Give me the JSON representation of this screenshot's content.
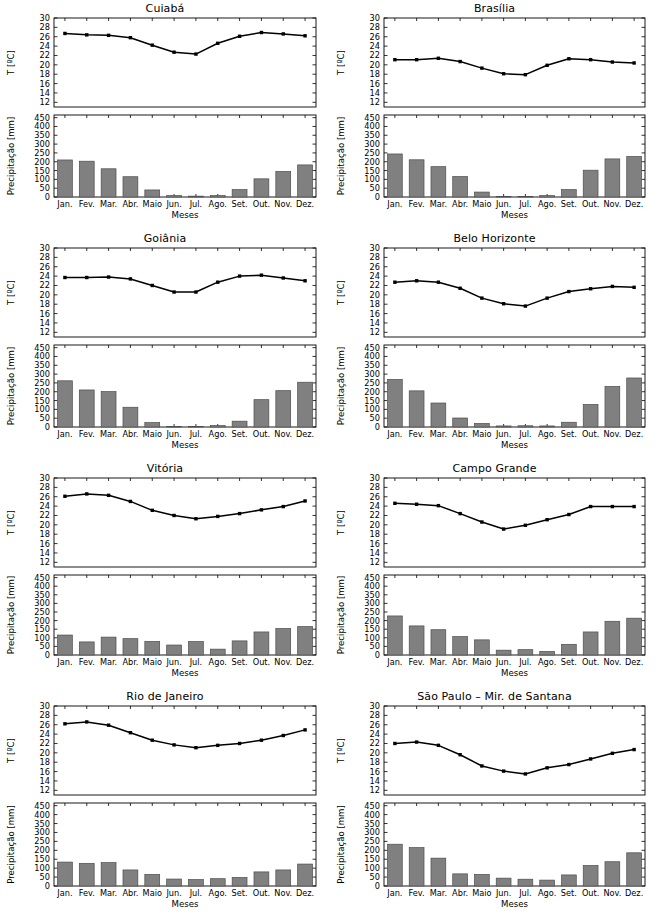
{
  "figure": {
    "months": [
      "Jan.",
      "Fev.",
      "Mar.",
      "Abr.",
      "Maio",
      "Jun.",
      "Jul.",
      "Ago.",
      "Set.",
      "Out.",
      "Nov.",
      "Dez."
    ],
    "temp_axis_label": "T [ºC]",
    "precip_axis_label": "Precipitação [mm]",
    "x_axis_label": "Meses",
    "temp_ticks": [
      12,
      14,
      16,
      18,
      20,
      22,
      24,
      26,
      28,
      30
    ],
    "precip_ticks": [
      0,
      50,
      100,
      150,
      200,
      250,
      300,
      350,
      400,
      450
    ],
    "temp_ylim": [
      11,
      30
    ],
    "precip_ylim": [
      0,
      465
    ],
    "bar_color": "#808080",
    "bar_edge_color": "#4d4d4d",
    "line_color": "#000000"
  },
  "panels": [
    {
      "title": "Cuiabá",
      "temp_label": "T [ºC]",
      "precip_label": "Precipitação [mm]",
      "x_label": "Meses"
    },
    {
      "title": "Brasília",
      "temp_label": "T [ºC]",
      "precip_label": "Precipitação [mm]",
      "x_label": "Meses"
    },
    {
      "title": "Goiânia",
      "temp_label": "T [ºC]",
      "precip_label": "Precipitação [mm]",
      "x_label": "Meses"
    },
    {
      "title": "Belo Horizonte",
      "temp_label": "T [ºC]",
      "precip_label": "Precipitação [mm]",
      "x_label": "Meses"
    },
    {
      "title": "Vitória",
      "temp_label": "T [ºC]",
      "precip_label": "Precipitação [mm]",
      "x_label": "Meses"
    },
    {
      "title": "Campo Grande",
      "temp_label": "T [ºC]",
      "precip_label": "Precipitação [mm]",
      "x_label": "Meses"
    },
    {
      "title": "Rio de Janeiro",
      "temp_label": "T [ºC]",
      "precip_label": "Precipitação [mm]",
      "x_label": "Meses"
    },
    {
      "title": "São Paulo – Mir. de Santana",
      "temp_label": "T [ºC]",
      "precip_label": "Precipitação [mm]",
      "x_label": "Meses"
    }
  ],
  "chart_data": [
    {
      "type": "line",
      "title": "Cuiabá",
      "subtitle": "temperature",
      "xlabel": "Meses",
      "ylabel": "T [ºC]",
      "ylim": [
        11,
        30
      ],
      "grid": false,
      "categories": [
        "Jan.",
        "Fev.",
        "Mar.",
        "Abr.",
        "Maio",
        "Jun.",
        "Jul.",
        "Ago.",
        "Set.",
        "Out.",
        "Nov.",
        "Dez."
      ],
      "values": [
        26.7,
        26.4,
        26.3,
        25.8,
        24.2,
        22.7,
        22.3,
        24.6,
        26.1,
        26.9,
        26.6,
        26.2
      ]
    },
    {
      "type": "bar",
      "title": "Cuiabá",
      "subtitle": "precipitation",
      "xlabel": "Meses",
      "ylabel": "Precipitação [mm]",
      "ylim": [
        0,
        465
      ],
      "grid": false,
      "categories": [
        "Jan.",
        "Fev.",
        "Mar.",
        "Abr.",
        "Maio",
        "Jun.",
        "Jul.",
        "Ago.",
        "Set.",
        "Out.",
        "Nov.",
        "Dez."
      ],
      "values": [
        210,
        203,
        160,
        115,
        40,
        8,
        5,
        8,
        42,
        103,
        145,
        182
      ]
    },
    {
      "type": "line",
      "title": "Brasília",
      "subtitle": "temperature",
      "xlabel": "Meses",
      "ylabel": "T [ºC]",
      "ylim": [
        11,
        30
      ],
      "grid": false,
      "categories": [
        "Jan.",
        "Fev.",
        "Mar.",
        "Abr.",
        "Maio",
        "Jun.",
        "Jul.",
        "Ago.",
        "Set.",
        "Out.",
        "Nov.",
        "Dez."
      ],
      "values": [
        21.1,
        21.1,
        21.4,
        20.7,
        19.3,
        18.1,
        17.9,
        19.9,
        21.3,
        21.1,
        20.6,
        20.4
      ]
    },
    {
      "type": "bar",
      "title": "Brasília",
      "subtitle": "precipitation",
      "xlabel": "Meses",
      "ylabel": "Precipitação [mm]",
      "ylim": [
        0,
        465
      ],
      "grid": false,
      "categories": [
        "Jan.",
        "Fev.",
        "Mar.",
        "Abr.",
        "Maio",
        "Jun.",
        "Jul.",
        "Ago.",
        "Set.",
        "Out.",
        "Nov.",
        "Dez."
      ],
      "values": [
        244,
        211,
        172,
        116,
        28,
        3,
        3,
        8,
        42,
        152,
        216,
        230
      ]
    },
    {
      "type": "line",
      "title": "Goiânia",
      "subtitle": "temperature",
      "xlabel": "Meses",
      "ylabel": "T [ºC]",
      "ylim": [
        11,
        30
      ],
      "grid": false,
      "categories": [
        "Jan.",
        "Fev.",
        "Mar.",
        "Abr.",
        "Maio",
        "Jun.",
        "Jul.",
        "Ago.",
        "Set.",
        "Out.",
        "Nov.",
        "Dez."
      ],
      "values": [
        23.7,
        23.7,
        23.8,
        23.4,
        22.0,
        20.6,
        20.6,
        22.7,
        24.0,
        24.2,
        23.6,
        23.0
      ]
    },
    {
      "type": "bar",
      "title": "Goiânia",
      "subtitle": "precipitation",
      "xlabel": "Meses",
      "ylabel": "Precipitação [mm]",
      "ylim": [
        0,
        465
      ],
      "grid": false,
      "categories": [
        "Jan.",
        "Fev.",
        "Mar.",
        "Abr.",
        "Maio",
        "Jun.",
        "Jul.",
        "Ago.",
        "Set.",
        "Out.",
        "Nov.",
        "Dez."
      ],
      "values": [
        262,
        210,
        201,
        112,
        25,
        3,
        2,
        8,
        33,
        155,
        206,
        254
      ]
    },
    {
      "type": "line",
      "title": "Belo Horizonte",
      "subtitle": "temperature",
      "xlabel": "Meses",
      "ylabel": "T [ºC]",
      "ylim": [
        11,
        30
      ],
      "grid": false,
      "categories": [
        "Jan.",
        "Fev.",
        "Mar.",
        "Abr.",
        "Maio",
        "Jun.",
        "Jul.",
        "Ago.",
        "Set.",
        "Out.",
        "Nov.",
        "Dez."
      ],
      "values": [
        22.7,
        23.0,
        22.7,
        21.4,
        19.3,
        18.1,
        17.6,
        19.3,
        20.7,
        21.3,
        21.8,
        21.6
      ]
    },
    {
      "type": "bar",
      "title": "Belo Horizonte",
      "subtitle": "precipitation",
      "xlabel": "Meses",
      "ylabel": "Precipitação [mm]",
      "ylim": [
        0,
        465
      ],
      "grid": false,
      "categories": [
        "Jan.",
        "Fev.",
        "Mar.",
        "Abr.",
        "Maio",
        "Jun.",
        "Jul.",
        "Ago.",
        "Set.",
        "Out.",
        "Nov.",
        "Dez."
      ],
      "values": [
        270,
        205,
        136,
        51,
        20,
        6,
        7,
        6,
        27,
        128,
        230,
        278
      ]
    },
    {
      "type": "line",
      "title": "Vitória",
      "subtitle": "temperature",
      "xlabel": "Meses",
      "ylabel": "T [ºC]",
      "ylim": [
        11,
        30
      ],
      "grid": false,
      "categories": [
        "Jan.",
        "Fev.",
        "Mar.",
        "Abr.",
        "Maio",
        "Jun.",
        "Jul.",
        "Ago.",
        "Set.",
        "Out.",
        "Nov.",
        "Dez."
      ],
      "values": [
        26.1,
        26.6,
        26.3,
        25.0,
        23.1,
        22.0,
        21.3,
        21.8,
        22.4,
        23.2,
        23.9,
        25.1
      ]
    },
    {
      "type": "bar",
      "title": "Vitória",
      "subtitle": "precipitation",
      "xlabel": "Meses",
      "ylabel": "Precipitação [mm]",
      "ylim": [
        0,
        465
      ],
      "grid": false,
      "categories": [
        "Jan.",
        "Fev.",
        "Mar.",
        "Abr.",
        "Maio",
        "Jun.",
        "Jul.",
        "Ago.",
        "Set.",
        "Out.",
        "Nov.",
        "Dez."
      ],
      "values": [
        116,
        76,
        104,
        95,
        79,
        58,
        78,
        34,
        82,
        134,
        154,
        165
      ]
    },
    {
      "type": "line",
      "title": "Campo Grande",
      "subtitle": "temperature",
      "xlabel": "Meses",
      "ylabel": "T [ºC]",
      "ylim": [
        11,
        30
      ],
      "grid": false,
      "categories": [
        "Jan.",
        "Fev.",
        "Mar.",
        "Abr.",
        "Maio",
        "Jun.",
        "Jul.",
        "Ago.",
        "Set.",
        "Out.",
        "Nov.",
        "Dez."
      ],
      "values": [
        24.6,
        24.4,
        24.1,
        22.4,
        20.6,
        19.1,
        19.9,
        21.1,
        22.2,
        23.9,
        23.9,
        23.9
      ]
    },
    {
      "type": "bar",
      "title": "Campo Grande",
      "subtitle": "precipitation",
      "xlabel": "Meses",
      "ylabel": "Precipitação [mm]",
      "ylim": [
        0,
        465
      ],
      "grid": false,
      "categories": [
        "Jan.",
        "Fev.",
        "Mar.",
        "Abr.",
        "Maio",
        "Jun.",
        "Jul.",
        "Ago.",
        "Set.",
        "Out.",
        "Nov.",
        "Dez."
      ],
      "values": [
        227,
        169,
        147,
        107,
        88,
        28,
        31,
        21,
        62,
        134,
        196,
        214
      ]
    },
    {
      "type": "line",
      "title": "Rio de Janeiro",
      "subtitle": "temperature",
      "xlabel": "Meses",
      "ylabel": "T [ºC]",
      "ylim": [
        11,
        30
      ],
      "grid": false,
      "categories": [
        "Jan.",
        "Fev.",
        "Mar.",
        "Abr.",
        "Maio",
        "Jun.",
        "Jul.",
        "Ago.",
        "Set.",
        "Out.",
        "Nov.",
        "Dez."
      ],
      "values": [
        26.2,
        26.6,
        25.9,
        24.3,
        22.7,
        21.7,
        21.1,
        21.6,
        22.0,
        22.7,
        23.7,
        24.9
      ]
    },
    {
      "type": "bar",
      "title": "Rio de Janeiro",
      "subtitle": "precipitation",
      "xlabel": "Meses",
      "ylabel": "Precipitação [mm]",
      "ylim": [
        0,
        465
      ],
      "grid": false,
      "categories": [
        "Jan.",
        "Fev.",
        "Mar.",
        "Abr.",
        "Maio",
        "Jun.",
        "Jul.",
        "Ago.",
        "Set.",
        "Out.",
        "Nov.",
        "Dez."
      ],
      "values": [
        134,
        127,
        131,
        90,
        65,
        39,
        36,
        41,
        48,
        79,
        90,
        123
      ]
    },
    {
      "type": "line",
      "title": "São Paulo – Mir. de Santana",
      "subtitle": "temperature",
      "xlabel": "Meses",
      "ylabel": "T [ºC]",
      "ylim": [
        11,
        30
      ],
      "grid": false,
      "categories": [
        "Jan.",
        "Fev.",
        "Mar.",
        "Abr.",
        "Maio",
        "Jun.",
        "Jul.",
        "Ago.",
        "Set.",
        "Out.",
        "Nov.",
        "Dez."
      ],
      "values": [
        22.0,
        22.3,
        21.6,
        19.6,
        17.2,
        16.1,
        15.5,
        16.8,
        17.5,
        18.7,
        19.9,
        20.7
      ]
    },
    {
      "type": "bar",
      "title": "São Paulo – Mir. de Santana",
      "subtitle": "precipitation",
      "xlabel": "Meses",
      "ylabel": "Precipitação [mm]",
      "ylim": [
        0,
        465
      ],
      "grid": false,
      "categories": [
        "Jan.",
        "Fev.",
        "Mar.",
        "Abr.",
        "Maio",
        "Jun.",
        "Jul.",
        "Ago.",
        "Set.",
        "Out.",
        "Nov.",
        "Dez."
      ],
      "values": [
        234,
        215,
        156,
        68,
        65,
        44,
        38,
        33,
        62,
        115,
        136,
        186
      ]
    }
  ]
}
